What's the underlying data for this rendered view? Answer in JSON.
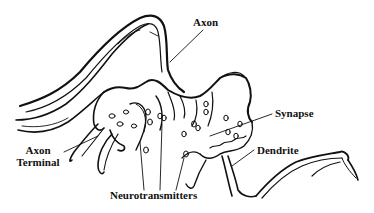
{
  "diagram": {
    "type": "anatomical-line-drawing",
    "colors": {
      "background": "#ffffff",
      "ink": "#111111"
    },
    "labels": {
      "axon": "Axon",
      "axon_terminal_line1": "Axon",
      "axon_terminal_line2": "Terminal",
      "synapse": "Synapse",
      "dendrite": "Dendrite",
      "neurotransmitters": "Neurotransmitters"
    }
  }
}
